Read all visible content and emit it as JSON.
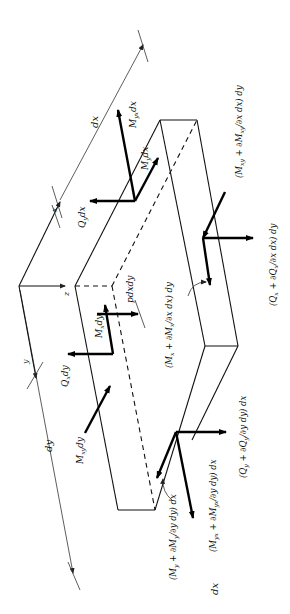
{
  "figure": {
    "orientation": "rotated 90 degrees",
    "axes": {
      "x": "x",
      "y": "y",
      "z": "z"
    },
    "dimensions": {
      "dx": "dx",
      "dy": "dy"
    },
    "load": "pdxdy",
    "labels": {
      "Myx_dx": "M",
      "Myx_dx_sub": "yx",
      "Myx_dx_tail": "dx",
      "My_dx": "M",
      "My_dx_sub": "y",
      "My_dx_tail": "dx",
      "Qy_dx": "Q",
      "Qy_dx_sub": "y",
      "Qy_dx_tail": "dx",
      "Mx_dy": "M",
      "Mx_dy_sub": "x",
      "Mx_dy_tail": "dy",
      "Qx_dy": "Q",
      "Qx_dy_sub": "x",
      "Qx_dy_tail": "dy",
      "Mxy_dy": "M",
      "Mxy_dy_sub": "xy",
      "Mxy_dy_tail": "dy"
    },
    "expressions": {
      "Mxy_plus": "(Mxy + ∂Mxy/∂x dx) dy",
      "Qx_plus": "(Qx + ∂Qx/∂x dx) dy",
      "Mx_plus": "(Mx + ∂Mx/∂x dx) dy",
      "Qy_plus": "(Qy + ∂Qy/∂y dy) dx",
      "Myx_plus": "(Myx + ∂Myx/∂y dy) dx",
      "My_plus": "(My + ∂My/∂y dy) dx"
    }
  }
}
